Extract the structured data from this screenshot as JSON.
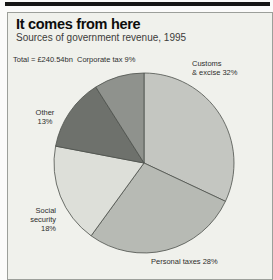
{
  "header": {
    "title": "It comes from here",
    "subtitle": "Sources of government revenue, 1995"
  },
  "chart_data": {
    "type": "pie",
    "title": "It comes from here",
    "subtitle": "Sources of government revenue, 1995",
    "total_label": "Total = £240.54bn",
    "total_value": "£240.54bn",
    "year": "1995",
    "start_angle_deg": 0,
    "direction": "clockwise",
    "outline_color": "#4d504b",
    "background_color": "#f0f1ec",
    "slices": [
      {
        "label": "Customs & excise",
        "value_pct": 32,
        "color": "#c4c6c1"
      },
      {
        "label": "Personal taxes",
        "value_pct": 28,
        "color": "#b7bab4"
      },
      {
        "label": "Social security",
        "value_pct": 18,
        "color": "#dddfd9"
      },
      {
        "label": "Other",
        "value_pct": 13,
        "color": "#6e716c"
      },
      {
        "label": "Corporate tax",
        "value_pct": 9,
        "color": "#8f928d"
      }
    ]
  },
  "labels": {
    "total": "Total = £240.54bn",
    "corporate": "Corporate tax 9%",
    "customs_line1": "Customs",
    "customs_line2": "& excise 32%",
    "other_line1": "Other",
    "other_line2": "13%",
    "social_line1": "Social security",
    "social_line2": "18%",
    "personal": "Personal taxes 28%"
  }
}
